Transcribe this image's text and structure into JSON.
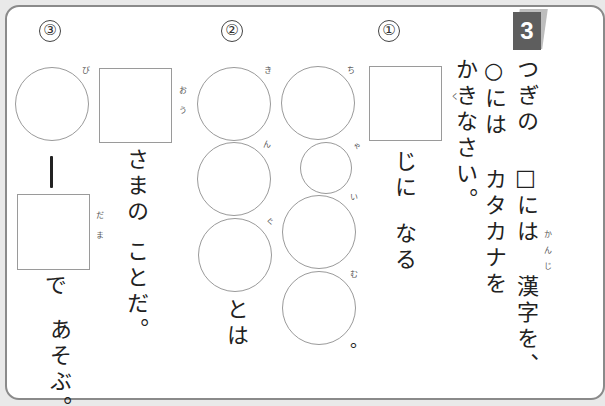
{
  "problem": {
    "number": "3",
    "instructions": {
      "line1": "つぎの □には 漢字を、",
      "line2": "○には カタカナを",
      "line3": "かきなさい。",
      "furigana_kanji": "かんじ"
    }
  },
  "questions": [
    {
      "label": "①",
      "kanji_box_furigana": "く",
      "text_after_box_1": "じに",
      "text_after_box_2": "なる",
      "katakana_circles": [
        "ち",
        "ゃ",
        "い",
        "む"
      ],
      "ending": "。"
    },
    {
      "label": "②",
      "katakana_circles": [
        "き",
        "ん",
        "ぐ"
      ],
      "ending": "とは"
    },
    {
      "label": "③",
      "kanji_box_furigana": "おう",
      "text_after_box_1": "さまの",
      "text_after_box_2": "ことだ。",
      "katakana_circle_furigana": "び",
      "long_vowel_mark": "ー",
      "kanji_box2_furigana": "だま",
      "text_after_box2_1": "で",
      "text_after_box2_2": "あそぶ。"
    }
  ],
  "colors": {
    "frame_border": "#8a8a8a",
    "badge": "#5e5e5e",
    "box_border": "#9a9a9a",
    "background": "#e9e9e9"
  }
}
